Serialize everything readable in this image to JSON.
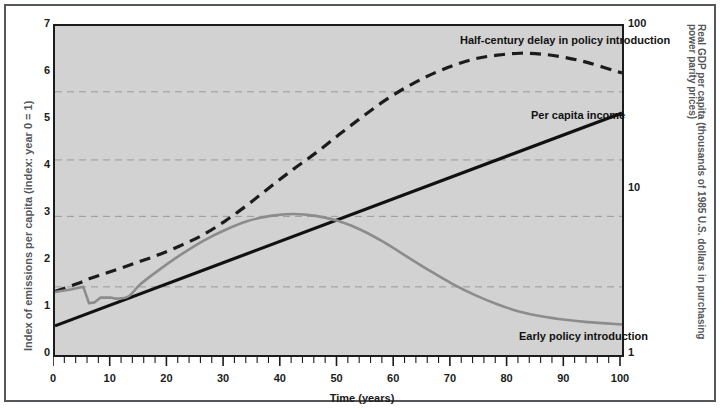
{
  "chart_data": {
    "type": "line",
    "title": "",
    "xlabel": "Time (years)",
    "ylabel": "Index of emissions per capita (index: year 0 = 1)",
    "y2label": "Real GDP per capita (thousands of 1985 U.S. dollars in purchasing power parity prices)",
    "xlim": [
      0,
      100
    ],
    "ylim": [
      0,
      7
    ],
    "y2lim": [
      1,
      100
    ],
    "y2scale": "log",
    "grid": true,
    "grid_values_left": [
      1.45,
      2.95,
      4.15,
      5.6
    ],
    "xticks": [
      0,
      10,
      20,
      30,
      40,
      50,
      60,
      70,
      80,
      90,
      100
    ],
    "xtick_labels": [
      "0",
      "10",
      "20",
      "30",
      "40",
      "50",
      "60",
      "70",
      "80",
      "90",
      "100"
    ],
    "xminor_step": 2,
    "yticks": [
      0,
      1,
      2,
      3,
      4,
      5,
      6,
      7
    ],
    "ytick_labels": [
      "0",
      "1",
      "2",
      "3",
      "4",
      "5",
      "6",
      "7"
    ],
    "y2ticks": [
      1,
      10,
      100
    ],
    "y2tick_labels": [
      "1",
      "10",
      "100"
    ],
    "legend_position": "inline-annotations",
    "series": [
      {
        "name": "Half-century delay in policy introduction",
        "style": "dashed",
        "color": "#1c1c1c",
        "x": [
          0,
          4,
          6,
          8,
          10,
          14,
          18,
          22,
          26,
          30,
          34,
          38,
          42,
          46,
          50,
          54,
          58,
          62,
          66,
          70,
          74,
          78,
          82,
          86,
          90,
          94,
          100
        ],
        "values": [
          1.35,
          1.52,
          1.62,
          1.7,
          1.78,
          1.95,
          2.12,
          2.32,
          2.55,
          2.85,
          3.2,
          3.58,
          3.95,
          4.3,
          4.68,
          5.05,
          5.4,
          5.7,
          5.95,
          6.15,
          6.3,
          6.38,
          6.42,
          6.4,
          6.33,
          6.22,
          6.0
        ]
      },
      {
        "name": "Per capita income",
        "style": "solid",
        "color": "#111111",
        "x": [
          0,
          100
        ],
        "values": [
          0.62,
          5.15
        ]
      },
      {
        "name": "Early policy introduction",
        "style": "solid",
        "color": "#8c8c8c",
        "x": [
          0,
          3,
          5,
          6,
          7,
          8,
          10,
          11,
          13,
          15,
          18,
          22,
          26,
          30,
          34,
          38,
          42,
          46,
          50,
          54,
          58,
          62,
          66,
          70,
          74,
          78,
          82,
          86,
          90,
          94,
          100
        ],
        "values": [
          1.34,
          1.4,
          1.45,
          1.1,
          1.12,
          1.22,
          1.22,
          1.2,
          1.25,
          1.5,
          1.78,
          2.12,
          2.42,
          2.66,
          2.85,
          2.96,
          3.0,
          2.96,
          2.85,
          2.66,
          2.4,
          2.1,
          1.8,
          1.52,
          1.28,
          1.08,
          0.92,
          0.82,
          0.75,
          0.7,
          0.65
        ]
      }
    ],
    "annotations": [
      {
        "text": "Half-century delay in policy introduction",
        "x_px": 452,
        "y_px": 26
      },
      {
        "text": "Per capita income",
        "x_px": 523,
        "y_px": 101
      },
      {
        "text": "Early policy introduction",
        "x_px": 511,
        "y_px": 322
      }
    ]
  },
  "caption": {
    "text": ""
  }
}
